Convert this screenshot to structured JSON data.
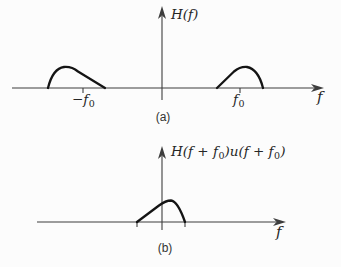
{
  "palette": {
    "background": "#fcfcfc",
    "axis_color": "#3d3d3d",
    "curve_color": "#141414",
    "text_color": "#262626"
  },
  "fig_a": {
    "y_axis_label": "H(f)",
    "x_axis_label": "f",
    "neg_tick_label": {
      "main": "−f",
      "sub": "0"
    },
    "pos_tick_label": {
      "main": "f",
      "sub": "0"
    },
    "caption": "(a)",
    "left_hump_path": "M 48,88 C 51,76 56,68 64,67 C 70,66.5 75,69 78,71.5 L 105,88",
    "right_hump_path": "M 217,88 L 234,71.5 C 237,69 241,66.5 247,67 C 255,68.5 260,76 263,88"
  },
  "fig_b": {
    "y_axis_label": {
      "p1": "H(f + f",
      "s1": "0",
      "p2": ")u(f + f",
      "s2": "0",
      "p3": ")"
    },
    "x_axis_label": "f",
    "caption": "(b)",
    "hump_path": "M 137,222 L 159,205.5 C 163,202.5 167,200.5 171,200.5 C 176.5,201 181,210.5 185,222"
  }
}
